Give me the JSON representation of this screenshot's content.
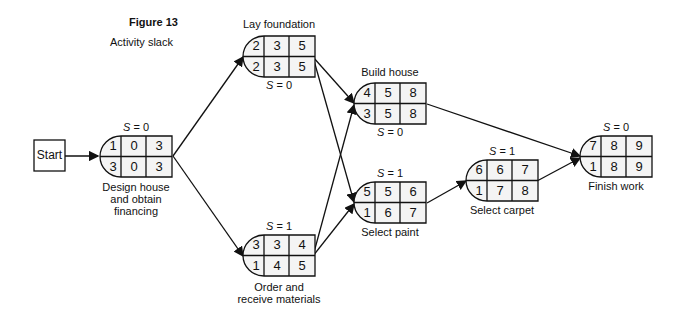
{
  "figure": {
    "title": "Figure 13",
    "subtitle": "Activity slack"
  },
  "start": {
    "label": "Start"
  },
  "nodes": [
    {
      "id": "design",
      "label_lines": [
        "Design house",
        "and obtain",
        "financing"
      ],
      "slack": "= 0",
      "top": [
        "1",
        "0",
        "3"
      ],
      "bottom": [
        "3",
        "0",
        "3"
      ]
    },
    {
      "id": "foundation",
      "label_lines": [
        "Lay foundation"
      ],
      "slack": "= 0",
      "top": [
        "2",
        "3",
        "5"
      ],
      "bottom": [
        "2",
        "3",
        "5"
      ]
    },
    {
      "id": "materials",
      "label_lines": [
        "Order and",
        "receive materials"
      ],
      "slack": "= 1",
      "top": [
        "3",
        "3",
        "4"
      ],
      "bottom": [
        "1",
        "4",
        "5"
      ]
    },
    {
      "id": "build",
      "label_lines": [
        "Build house"
      ],
      "slack": "= 0",
      "top": [
        "4",
        "5",
        "8"
      ],
      "bottom": [
        "3",
        "5",
        "8"
      ]
    },
    {
      "id": "paint",
      "label_lines": [
        "Select paint"
      ],
      "slack": "= 1",
      "top": [
        "5",
        "5",
        "6"
      ],
      "bottom": [
        "1",
        "6",
        "7"
      ]
    },
    {
      "id": "carpet",
      "label_lines": [
        "Select carpet"
      ],
      "slack": "= 1",
      "top": [
        "6",
        "6",
        "7"
      ],
      "bottom": [
        "1",
        "7",
        "8"
      ]
    },
    {
      "id": "finish",
      "label_lines": [
        "Finish work"
      ],
      "slack": "= 0",
      "top": [
        "7",
        "8",
        "9"
      ],
      "bottom": [
        "1",
        "8",
        "9"
      ]
    }
  ],
  "slack_symbol": "S"
}
